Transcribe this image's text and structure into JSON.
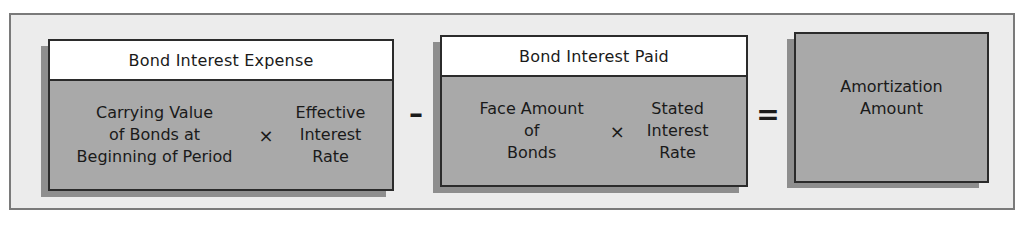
{
  "diagram": {
    "colors": {
      "frame_bg": "#ececec",
      "box_fill": "#a9a9a9",
      "header_fill": "#ffffff",
      "border": "#2b2b2b",
      "shadow": "#8e8e8e"
    },
    "box1": {
      "header": "Bond Interest Expense",
      "left_term": "Carrying Value\nof Bonds at\nBeginning of Period",
      "operator": "×",
      "right_term": "Effective\nInterest\nRate"
    },
    "op1": "–",
    "box2": {
      "header": "Bond Interest Paid",
      "left_term": "Face Amount\nof\nBonds",
      "operator": "×",
      "right_term": "Stated\nInterest\nRate"
    },
    "op2": "=",
    "box3": {
      "label": "Amortization\nAmount"
    }
  }
}
